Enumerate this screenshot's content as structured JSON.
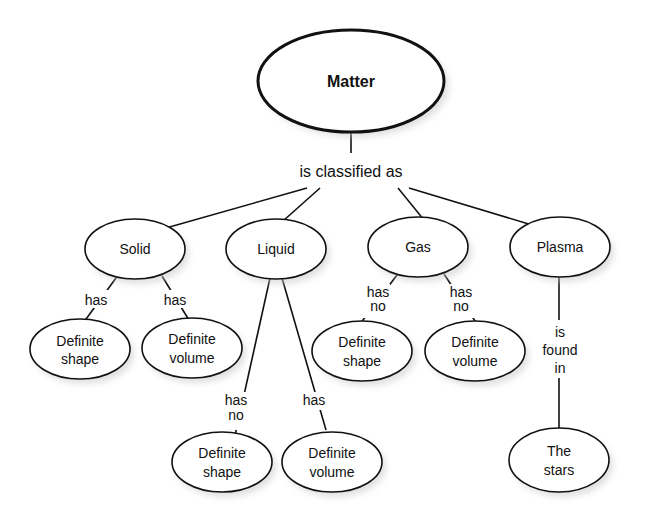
{
  "diagram": {
    "type": "concept-map",
    "root": {
      "id": "matter",
      "label": "Matter"
    },
    "root_link": "is classified as",
    "states": [
      {
        "id": "solid",
        "label": "Solid"
      },
      {
        "id": "liquid",
        "label": "Liquid"
      },
      {
        "id": "gas",
        "label": "Gas"
      },
      {
        "id": "plasma",
        "label": "Plasma"
      }
    ],
    "leaves": [
      {
        "id": "solid-shape",
        "parent": "solid",
        "line1": "Definite",
        "line2": "shape",
        "link1": "has",
        "link2": ""
      },
      {
        "id": "solid-volume",
        "parent": "solid",
        "line1": "Definite",
        "line2": "volume",
        "link1": "has",
        "link2": ""
      },
      {
        "id": "liquid-shape",
        "parent": "liquid",
        "line1": "Definite",
        "line2": "shape",
        "link1": "has",
        "link2": "no"
      },
      {
        "id": "liquid-volume",
        "parent": "liquid",
        "line1": "Definite",
        "line2": "volume",
        "link1": "has",
        "link2": ""
      },
      {
        "id": "gas-shape",
        "parent": "gas",
        "line1": "Definite",
        "line2": "shape",
        "link1": "has",
        "link2": "no"
      },
      {
        "id": "gas-volume",
        "parent": "gas",
        "line1": "Definite",
        "line2": "volume",
        "link1": "has",
        "link2": "no"
      },
      {
        "id": "plasma-stars",
        "parent": "plasma",
        "line1": "The",
        "line2": "stars",
        "link1": "is",
        "link2": "found",
        "link3": "in"
      }
    ]
  }
}
